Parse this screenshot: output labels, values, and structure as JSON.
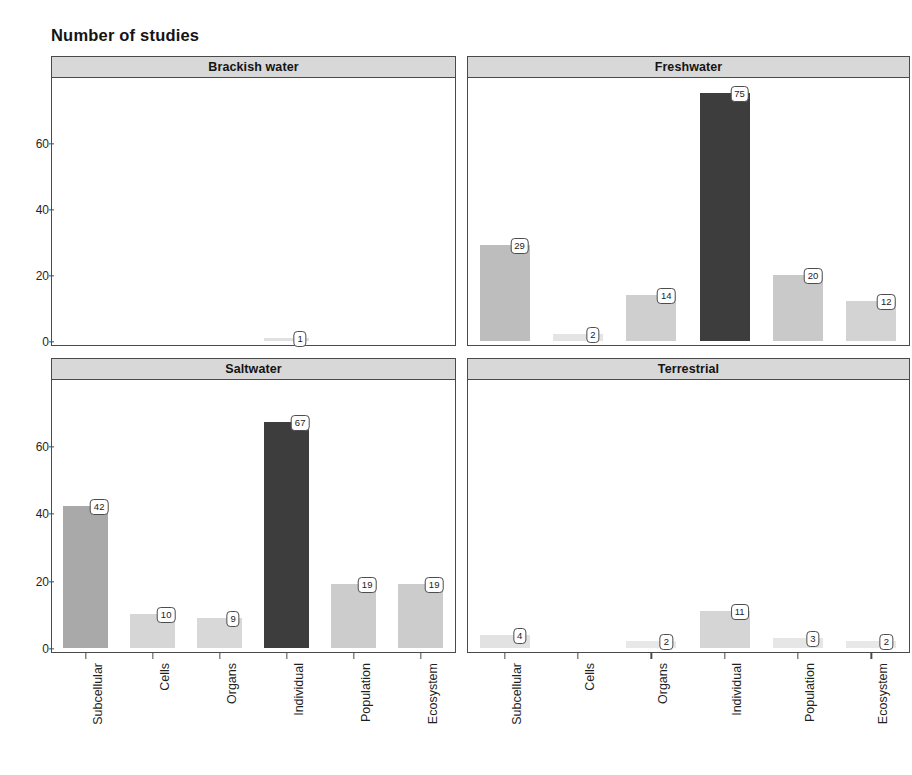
{
  "chart_data": {
    "type": "bar",
    "title": "Number of studies",
    "xlabel": "",
    "ylabel": "",
    "ylim": [
      0,
      78
    ],
    "grid": false,
    "legend": "none",
    "layout": "2x2 faceted panels",
    "categories": [
      "Subcellular",
      "Cells",
      "Organs",
      "Individual",
      "Population",
      "Ecosystem"
    ],
    "y_ticks": [
      "0",
      "20",
      "40",
      "60"
    ],
    "y_tick_values": [
      0,
      20,
      40,
      60
    ],
    "panels": [
      {
        "name": "Brackish water",
        "position": "top-left",
        "values": [
          0,
          0,
          0,
          1,
          0,
          0
        ],
        "labels": [
          "",
          "",
          "",
          "1",
          "",
          ""
        ],
        "colors": [
          "#ffffff",
          "#ffffff",
          "#ffffff",
          "#e0e0e0",
          "#ffffff",
          "#ffffff"
        ]
      },
      {
        "name": "Freshwater",
        "position": "top-right",
        "values": [
          29,
          2,
          14,
          75,
          20,
          12
        ],
        "labels": [
          "29",
          "2",
          "14",
          "75",
          "20",
          "12"
        ],
        "colors": [
          "#bdbdbd",
          "#e4e4e4",
          "#cfcfcf",
          "#3d3d3d",
          "#c9c9c9",
          "#d3d3d3"
        ]
      },
      {
        "name": "Saltwater",
        "position": "bottom-left",
        "values": [
          42,
          10,
          9,
          67,
          19,
          19
        ],
        "labels": [
          "42",
          "10",
          "9",
          "67",
          "19",
          "19"
        ],
        "colors": [
          "#a9a9a9",
          "#d6d6d6",
          "#d8d8d8",
          "#3d3d3d",
          "#cccccc",
          "#cccccc"
        ]
      },
      {
        "name": "Terrestrial",
        "position": "bottom-right",
        "values": [
          4,
          0,
          2,
          11,
          3,
          2
        ],
        "labels": [
          "4",
          "",
          "2",
          "11",
          "3",
          "2"
        ],
        "colors": [
          "#e2e2e2",
          "#ffffff",
          "#e8e8e8",
          "#d5d5d5",
          "#e6e6e6",
          "#e8e8e8"
        ]
      }
    ]
  },
  "title": "Number of studies",
  "panel_titles": {
    "brackish": "Brackish water",
    "freshwater": "Freshwater",
    "saltwater": "Saltwater",
    "terrestrial": "Terrestrial"
  },
  "colors": {
    "panel_strip_bg": "#d8d8d8",
    "panel_border": "#4a4a4a",
    "bar_dark": "#3d3d3d",
    "bar_mid": "#a9a9a9",
    "bar_light": "#d6d6d6",
    "text": "#141414",
    "background": "#ffffff"
  }
}
